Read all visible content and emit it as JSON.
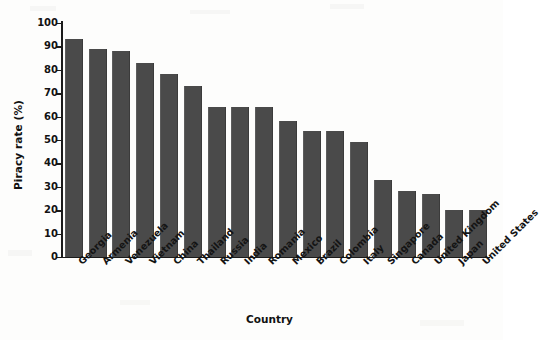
{
  "chart_data": {
    "type": "bar",
    "title": "",
    "xlabel": "Country",
    "ylabel": "Piracy rate (%)",
    "ylim": [
      0,
      100
    ],
    "ytick_values": [
      0,
      10,
      20,
      30,
      40,
      50,
      60,
      70,
      80,
      90,
      100
    ],
    "ytick_labels": [
      "0",
      "10",
      "20",
      "30",
      "40",
      "50",
      "60",
      "70",
      "80",
      "90",
      "100"
    ],
    "grid": false,
    "legend": "none",
    "bar_color": "#4a4a4a",
    "categories": [
      "Georgia",
      "Armenia",
      "Venezuela",
      "Vietnam",
      "China",
      "Thailand",
      "Russia",
      "India",
      "Romania",
      "Mexico",
      "Brazil",
      "Colombia",
      "Italy",
      "Singapore",
      "Canada",
      "United Kingdom",
      "Japan",
      "United States"
    ],
    "values": [
      93,
      89,
      88,
      83,
      78,
      73,
      64,
      64,
      64,
      58,
      54,
      54,
      49,
      33,
      28,
      27,
      20,
      20
    ]
  },
  "axes": {
    "y_title": "Piracy rate (%)",
    "x_title": "Country"
  }
}
